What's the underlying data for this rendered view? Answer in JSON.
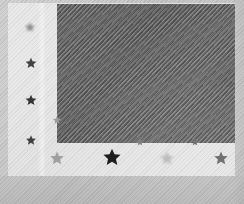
{
  "image": {
    "title": "Stylized flag graphic",
    "kind": "grayscale-raster",
    "width": 244,
    "height": 204,
    "alt_text": "Low-resolution grayscale image of a flag-like graphic: a dark rectangular canton over a light field, with small star markers along the left edge and across the lower band, rendered with a diagonal hatch texture."
  },
  "palette": {
    "outer_field": "#c9c9c9",
    "inner_panel": "#ebebeb",
    "canton": "#5c5c5c",
    "star_dark": "#141414",
    "star_mid": "#6f6f6f",
    "star_light": "#a8a8a8",
    "star_faint": "#c4c4c4"
  },
  "regions": {
    "outer_field_label": "outer mat",
    "inner_panel_label": "flag field",
    "canton_label": "canton block"
  },
  "canton": {
    "x": 57,
    "y": 4,
    "width": 178,
    "height": 139,
    "fill": "#5c5c5c",
    "texture": "diagonal-hatch"
  },
  "stars": {
    "left_column": [
      {
        "id": "star-left-1",
        "cx": 30,
        "cy": 27,
        "size": 11,
        "fill": "#8c8c8c",
        "blur": "softer"
      },
      {
        "id": "star-left-2",
        "cx": 31,
        "cy": 63,
        "size": 12,
        "fill": "#3b3b3b",
        "blur": "soft"
      },
      {
        "id": "star-left-3",
        "cx": 31,
        "cy": 100,
        "size": 12,
        "fill": "#2e2e2e",
        "blur": "soft"
      },
      {
        "id": "star-left-4",
        "cx": 31,
        "cy": 140,
        "size": 11,
        "fill": "#3a3a3a",
        "blur": "soft"
      }
    ],
    "bottom_row": [
      {
        "id": "star-bottom-1",
        "cx": 57,
        "cy": 158,
        "size": 15,
        "fill": "#9e9e9e",
        "blur": "soft"
      },
      {
        "id": "star-bottom-2",
        "cx": 112,
        "cy": 157,
        "size": 19,
        "fill": "#141414",
        "blur": "sharp"
      },
      {
        "id": "star-bottom-3",
        "cx": 167,
        "cy": 158,
        "size": 15,
        "fill": "#bdbdbd",
        "blur": "softer"
      },
      {
        "id": "star-bottom-4",
        "cx": 221,
        "cy": 158,
        "size": 15,
        "fill": "#6f6f6f",
        "blur": "soft"
      }
    ],
    "edge_specks": [
      {
        "id": "speck-edge-1",
        "cx": 57,
        "cy": 120,
        "size": 9,
        "fill": "#9a9a9a"
      },
      {
        "id": "speck-edge-2",
        "cx": 140,
        "cy": 142,
        "size": 8,
        "fill": "#7d7d7d"
      },
      {
        "id": "speck-edge-3",
        "cx": 195,
        "cy": 142,
        "size": 8,
        "fill": "#6e6e6e"
      }
    ]
  },
  "chart_data": {
    "type": "scatter",
    "xlabel": "x (px)",
    "ylabel": "y (px)",
    "xlim": [
      0,
      244
    ],
    "ylim": [
      204,
      0
    ],
    "grid": false,
    "legend": "none",
    "series": [
      {
        "name": "left column markers",
        "x": [
          30,
          31,
          31,
          31
        ],
        "y": [
          27,
          63,
          100,
          140
        ],
        "sizes": [
          11,
          12,
          12,
          11
        ],
        "shades": [
          "#8c8c8c",
          "#3b3b3b",
          "#2e2e2e",
          "#3a3a3a"
        ]
      },
      {
        "name": "bottom row markers",
        "x": [
          57,
          112,
          167,
          221
        ],
        "y": [
          158,
          157,
          158,
          158
        ],
        "sizes": [
          15,
          19,
          15,
          15
        ],
        "shades": [
          "#9e9e9e",
          "#141414",
          "#bdbdbd",
          "#6f6f6f"
        ]
      },
      {
        "name": "edge specks",
        "x": [
          57,
          140,
          195
        ],
        "y": [
          120,
          142,
          142
        ],
        "sizes": [
          9,
          8,
          8
        ],
        "shades": [
          "#9a9a9a",
          "#7d7d7d",
          "#6e6e6e"
        ]
      }
    ]
  }
}
